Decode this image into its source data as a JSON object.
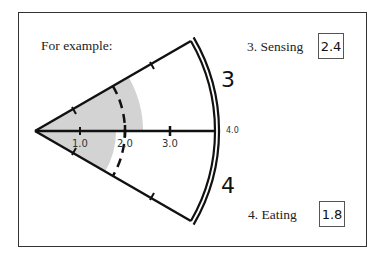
{
  "intro": {
    "label": "For example:"
  },
  "segments": [
    {
      "number": "3",
      "label": "3. Sensing",
      "value": "2.4"
    },
    {
      "number": "4",
      "label": "4. Eating",
      "value": "1.8"
    }
  ],
  "axis": {
    "ticks": [
      "1.0",
      "2.0",
      "3.0",
      "4.0"
    ],
    "max": 4.0
  },
  "colors": {
    "stroke": "#111111",
    "shade": "#d3d3d3",
    "frame": "#333333"
  }
}
